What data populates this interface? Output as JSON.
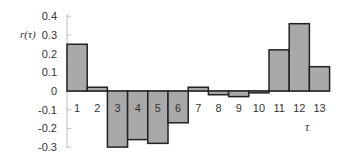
{
  "chart_data": {
    "type": "bar",
    "title": "",
    "xlabel": "τ",
    "ylabel": "r(τ)",
    "categories": [
      "1",
      "2",
      "3",
      "4",
      "5",
      "6",
      "7",
      "8",
      "9",
      "10",
      "11",
      "12",
      "13"
    ],
    "values": [
      0.25,
      0.02,
      -0.3,
      -0.26,
      -0.28,
      -0.17,
      0.02,
      -0.02,
      -0.03,
      -0.01,
      0.22,
      0.36,
      0.13
    ],
    "ylim": [
      -0.3,
      0.4
    ],
    "yticks": [
      0.4,
      0.3,
      0.2,
      0.1,
      0,
      -0.1,
      -0.2,
      -0.3
    ],
    "ytick_labels": [
      "0.4",
      "0.3",
      "0.2",
      "0.1",
      "0",
      "-0.1",
      "-0.2",
      "-0.3"
    ],
    "grid": false,
    "legend": null,
    "bar_color": "#a9a9a9",
    "edge_color": "#222222"
  }
}
